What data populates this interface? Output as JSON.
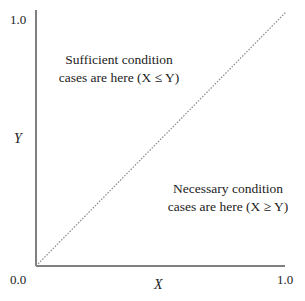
{
  "diagram": {
    "y_axis": {
      "label": "Y",
      "top_tick": "1.0"
    },
    "x_axis": {
      "label": "X",
      "right_tick": "1.0"
    },
    "origin_label": "0.0",
    "diagonal": {
      "style": "dotted",
      "from": [
        0.0,
        0.0
      ],
      "to": [
        1.0,
        1.0
      ]
    },
    "regions": {
      "upper_left": {
        "line1": "Sufficient condition",
        "line2": "cases are here (X ≤ Y)"
      },
      "lower_right": {
        "line1": "Necessary condition",
        "line2": "cases are here (X ≥ Y)"
      }
    },
    "colors": {
      "axis": "#555555",
      "diagonal": "#888888",
      "text": "#222222"
    }
  }
}
